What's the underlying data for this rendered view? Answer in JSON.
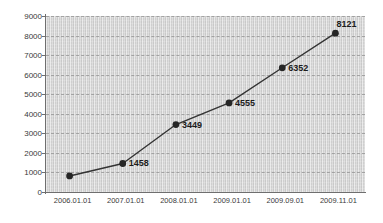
{
  "chart_data": {
    "type": "line",
    "title": "",
    "xlabel": "",
    "ylabel": "",
    "categories": [
      "2006.01.01",
      "2007.01.01",
      "2008.01.01",
      "2009.01.01",
      "2009.09.01",
      "2009.11.01"
    ],
    "values": [
      820,
      1458,
      3449,
      4555,
      6352,
      8121
    ],
    "point_labels": [
      "",
      "1458",
      "3449",
      "4555",
      "6352",
      "8121"
    ],
    "ylim": [
      0,
      9000
    ],
    "y_ticks": [
      0,
      1000,
      2000,
      3000,
      4000,
      5000,
      6000,
      7000,
      8000,
      9000
    ],
    "y_tick_labels": [
      "0",
      "1000",
      "2000",
      "3000",
      "4000",
      "5000",
      "6000",
      "7000",
      "8000",
      "9000"
    ],
    "grid": true,
    "grid_style": "dashed",
    "legend": false,
    "legend_position": "none",
    "series": [
      {
        "name": "",
        "values": [
          820,
          1458,
          3449,
          4555,
          6352,
          8121
        ]
      }
    ],
    "colors": {
      "line": "#333333",
      "marker": "#262626",
      "plot_background": "#d2d2d2",
      "gridline": "#9a9a9a",
      "axis": "#6f6f6f",
      "tick_text": "#3a3a3a",
      "label_text": "#1c1c1c"
    }
  }
}
